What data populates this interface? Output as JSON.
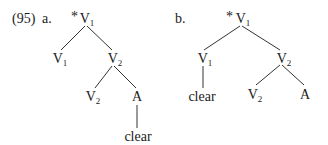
{
  "example": {
    "number": "(95)",
    "a": {
      "label": "a.",
      "root": {
        "star": "*",
        "cat": "V",
        "sub": "1"
      },
      "left": {
        "cat": "V",
        "sub": "1"
      },
      "right": {
        "cat": "V",
        "sub": "2"
      },
      "right_left": {
        "cat": "V",
        "sub": "2"
      },
      "right_right": {
        "cat": "A"
      },
      "leaf": "clear"
    },
    "b": {
      "label": "b.",
      "root": {
        "star": "*",
        "cat": "V",
        "sub": "1"
      },
      "left": {
        "cat": "V",
        "sub": "1"
      },
      "left_leaf": "clear",
      "right": {
        "cat": "V",
        "sub": "2"
      },
      "right_left": {
        "cat": "V",
        "sub": "2"
      },
      "right_right": {
        "cat": "A"
      }
    }
  }
}
